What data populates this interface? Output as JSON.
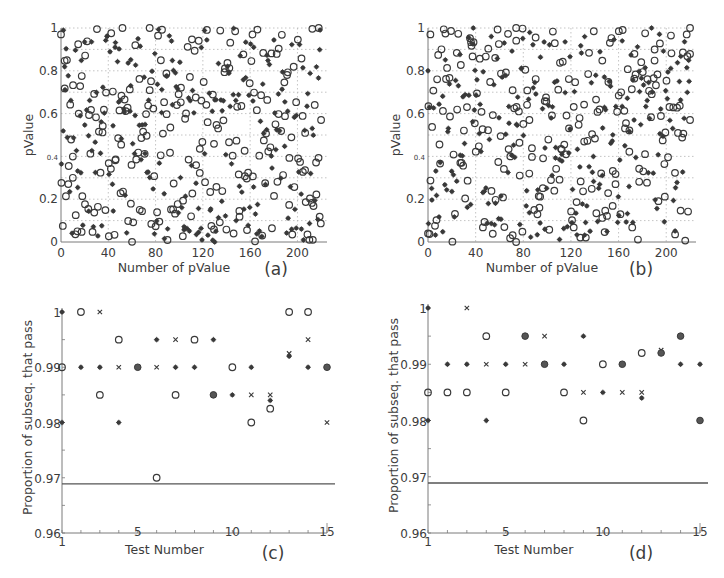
{
  "chart_data": [
    {
      "id": "a",
      "type": "scatter",
      "panel_label": "(a)",
      "xlabel": "Number of pValue",
      "ylabel": "pValue",
      "xlim": [
        0,
        225
      ],
      "ylim": [
        0,
        1
      ],
      "xticks": [
        0,
        40,
        80,
        120,
        160,
        200
      ],
      "yticks": [
        0,
        0.2,
        0.4,
        0.6,
        0.8,
        1
      ],
      "ytick_labels": [
        "0",
        "0.2",
        "0.4",
        "0.6",
        "0.8",
        "1"
      ],
      "grid": true,
      "grid_style": "dotted",
      "series": [
        {
          "name": "open circles",
          "marker": "o",
          "count": 220,
          "seed": 11
        },
        {
          "name": "filled asterisks",
          "marker": "*",
          "count": 220,
          "seed": 23
        }
      ],
      "sample_points": [
        {
          "x": 0,
          "y": 0.97,
          "m": "o"
        },
        {
          "x": 2,
          "y": 0.99,
          "m": "*"
        },
        {
          "x": 5,
          "y": 0.85,
          "m": "o"
        },
        {
          "x": 15,
          "y": 0.6,
          "m": "o"
        },
        {
          "x": 10,
          "y": 0.3,
          "m": "o"
        },
        {
          "x": 52,
          "y": 1.0,
          "m": "o"
        },
        {
          "x": 75,
          "y": 1.0,
          "m": "o"
        },
        {
          "x": 130,
          "y": 0.0,
          "m": "*"
        },
        {
          "x": 218,
          "y": 1.0,
          "m": "o"
        },
        {
          "x": 220,
          "y": 0.57,
          "m": "o"
        },
        {
          "x": 213,
          "y": 0.01,
          "m": "o"
        }
      ],
      "note": "~220 uniformly distributed p-values per series in [0,1]"
    },
    {
      "id": "b",
      "type": "scatter",
      "panel_label": "(b)",
      "xlabel": "Number of pValue",
      "ylabel": "pValue",
      "xlim": [
        0,
        225
      ],
      "ylim": [
        0,
        1
      ],
      "xticks": [
        0,
        40,
        80,
        120,
        160,
        200
      ],
      "yticks": [
        0,
        0.2,
        0.4,
        0.6,
        0.8,
        1
      ],
      "ytick_labels": [
        "0",
        "0.2",
        "0.4",
        "0.6",
        "0.8",
        "1"
      ],
      "grid": true,
      "grid_style": "dotted",
      "series": [
        {
          "name": "open circles",
          "marker": "o",
          "count": 220,
          "seed": 37
        },
        {
          "name": "filled asterisks",
          "marker": "*",
          "count": 220,
          "seed": 53
        }
      ],
      "sample_points": [
        {
          "x": 0,
          "y": 0.04,
          "m": "o"
        },
        {
          "x": 0,
          "y": 0.8,
          "m": "*"
        },
        {
          "x": 2,
          "y": 0.97,
          "m": "o"
        },
        {
          "x": 38,
          "y": 1.0,
          "m": "*"
        },
        {
          "x": 74,
          "y": 1.0,
          "m": "o"
        },
        {
          "x": 220,
          "y": 1.0,
          "m": "o"
        },
        {
          "x": 220,
          "y": 0.57,
          "m": "o"
        },
        {
          "x": 74,
          "y": 0.0,
          "m": "o"
        }
      ],
      "note": "~220 uniformly distributed p-values per series in [0,1]"
    },
    {
      "id": "c",
      "type": "scatter",
      "panel_label": "(c)",
      "xlabel": "Test Number",
      "ylabel": "Proportion of subseq. that pass",
      "xlim": [
        1,
        15
      ],
      "ylim": [
        0.96,
        1.0
      ],
      "xticks": [
        1,
        5,
        10,
        15
      ],
      "yticks": [
        0.96,
        0.97,
        0.98,
        0.99,
        1
      ],
      "ytick_labels": [
        "0.96",
        "0.97",
        "0.98",
        "0.99",
        "1"
      ],
      "threshold_line": 0.9689,
      "grid": false,
      "points": [
        {
          "x": 1,
          "y": 1.0,
          "m": "*"
        },
        {
          "x": 1,
          "y": 0.99,
          "m": "o"
        },
        {
          "x": 1,
          "y": 0.98,
          "m": "*"
        },
        {
          "x": 2,
          "y": 1.0,
          "m": "o"
        },
        {
          "x": 2,
          "y": 0.99,
          "m": "*"
        },
        {
          "x": 3,
          "y": 1.0,
          "m": "x"
        },
        {
          "x": 3,
          "y": 0.99,
          "m": "*"
        },
        {
          "x": 3,
          "y": 0.985,
          "m": "o"
        },
        {
          "x": 4,
          "y": 0.995,
          "m": "o"
        },
        {
          "x": 4,
          "y": 0.99,
          "m": "x"
        },
        {
          "x": 4,
          "y": 0.98,
          "m": "*"
        },
        {
          "x": 5,
          "y": 0.99,
          "m": "●"
        },
        {
          "x": 6,
          "y": 0.995,
          "m": "*"
        },
        {
          "x": 6,
          "y": 0.99,
          "m": "x"
        },
        {
          "x": 6,
          "y": 0.97,
          "m": "o"
        },
        {
          "x": 7,
          "y": 0.995,
          "m": "x"
        },
        {
          "x": 7,
          "y": 0.99,
          "m": "*"
        },
        {
          "x": 7,
          "y": 0.985,
          "m": "o"
        },
        {
          "x": 8,
          "y": 0.995,
          "m": "o"
        },
        {
          "x": 8,
          "y": 0.99,
          "m": "*"
        },
        {
          "x": 9,
          "y": 0.995,
          "m": "*"
        },
        {
          "x": 9,
          "y": 0.985,
          "m": "●"
        },
        {
          "x": 10,
          "y": 0.99,
          "m": "o"
        },
        {
          "x": 10,
          "y": 0.985,
          "m": "*"
        },
        {
          "x": 11,
          "y": 0.99,
          "m": "*"
        },
        {
          "x": 11,
          "y": 0.985,
          "m": "x"
        },
        {
          "x": 11,
          "y": 0.98,
          "m": "o"
        },
        {
          "x": 12,
          "y": 0.985,
          "m": "x"
        },
        {
          "x": 12,
          "y": 0.984,
          "m": "*"
        },
        {
          "x": 12,
          "y": 0.9825,
          "m": "o"
        },
        {
          "x": 13,
          "y": 1.0,
          "m": "o"
        },
        {
          "x": 13,
          "y": 0.9925,
          "m": "x"
        },
        {
          "x": 13,
          "y": 0.992,
          "m": "*"
        },
        {
          "x": 14,
          "y": 1.0,
          "m": "o"
        },
        {
          "x": 14,
          "y": 0.995,
          "m": "x"
        },
        {
          "x": 14,
          "y": 0.99,
          "m": "*"
        },
        {
          "x": 15,
          "y": 0.99,
          "m": "●"
        },
        {
          "x": 15,
          "y": 0.98,
          "m": "x"
        }
      ]
    },
    {
      "id": "d",
      "type": "scatter",
      "panel_label": "(d)",
      "xlabel": "Test Number",
      "ylabel": "Proportion of subseq. that pass",
      "xlim": [
        1,
        15
      ],
      "ylim": [
        0.96,
        1.0
      ],
      "xticks": [
        1,
        5,
        10,
        15
      ],
      "yticks": [
        0.96,
        0.97,
        0.98,
        0.99,
        1
      ],
      "ytick_labels": [
        "0.96",
        "0.97",
        "0.98",
        "0.99",
        "1"
      ],
      "threshold_line": 0.9689,
      "grid": false,
      "points": [
        {
          "x": 1,
          "y": 1.0,
          "m": "*"
        },
        {
          "x": 1,
          "y": 0.985,
          "m": "o"
        },
        {
          "x": 1,
          "y": 0.98,
          "m": "*"
        },
        {
          "x": 2,
          "y": 0.99,
          "m": "*"
        },
        {
          "x": 2,
          "y": 0.985,
          "m": "o"
        },
        {
          "x": 3,
          "y": 1.0,
          "m": "x"
        },
        {
          "x": 3,
          "y": 0.99,
          "m": "*"
        },
        {
          "x": 3,
          "y": 0.985,
          "m": "o"
        },
        {
          "x": 4,
          "y": 0.995,
          "m": "o"
        },
        {
          "x": 4,
          "y": 0.99,
          "m": "x"
        },
        {
          "x": 4,
          "y": 0.98,
          "m": "*"
        },
        {
          "x": 5,
          "y": 0.99,
          "m": "*"
        },
        {
          "x": 5,
          "y": 0.985,
          "m": "o"
        },
        {
          "x": 6,
          "y": 0.995,
          "m": "●"
        },
        {
          "x": 6,
          "y": 0.99,
          "m": "x"
        },
        {
          "x": 7,
          "y": 0.995,
          "m": "x"
        },
        {
          "x": 7,
          "y": 0.99,
          "m": "●"
        },
        {
          "x": 8,
          "y": 0.99,
          "m": "*"
        },
        {
          "x": 8,
          "y": 0.985,
          "m": "o"
        },
        {
          "x": 9,
          "y": 0.995,
          "m": "*"
        },
        {
          "x": 9,
          "y": 0.985,
          "m": "x"
        },
        {
          "x": 9,
          "y": 0.98,
          "m": "o"
        },
        {
          "x": 10,
          "y": 0.99,
          "m": "o"
        },
        {
          "x": 10,
          "y": 0.985,
          "m": "*"
        },
        {
          "x": 11,
          "y": 0.99,
          "m": "●"
        },
        {
          "x": 11,
          "y": 0.985,
          "m": "x"
        },
        {
          "x": 12,
          "y": 0.992,
          "m": "o"
        },
        {
          "x": 12,
          "y": 0.985,
          "m": "x"
        },
        {
          "x": 12,
          "y": 0.984,
          "m": "*"
        },
        {
          "x": 13,
          "y": 0.9925,
          "m": "x"
        },
        {
          "x": 13,
          "y": 0.992,
          "m": "●"
        },
        {
          "x": 14,
          "y": 0.995,
          "m": "●"
        },
        {
          "x": 14,
          "y": 0.99,
          "m": "*"
        },
        {
          "x": 15,
          "y": 0.99,
          "m": "*"
        },
        {
          "x": 15,
          "y": 0.98,
          "m": "●"
        }
      ]
    }
  ],
  "layout": {
    "panels": {
      "a": {
        "px": [
          61,
          28,
          327,
          242
        ]
      },
      "b": {
        "px": [
          428,
          28,
          696,
          242
        ]
      },
      "c": {
        "px": [
          62,
          312,
          327,
          533
        ]
      },
      "d": {
        "px": [
          428,
          308,
          700,
          533
        ]
      }
    },
    "colors": {
      "marker": "#3a3a3a",
      "axis": "#7a7a7a",
      "grid": "#b5b5b5",
      "text": "#3c3c3c"
    }
  }
}
